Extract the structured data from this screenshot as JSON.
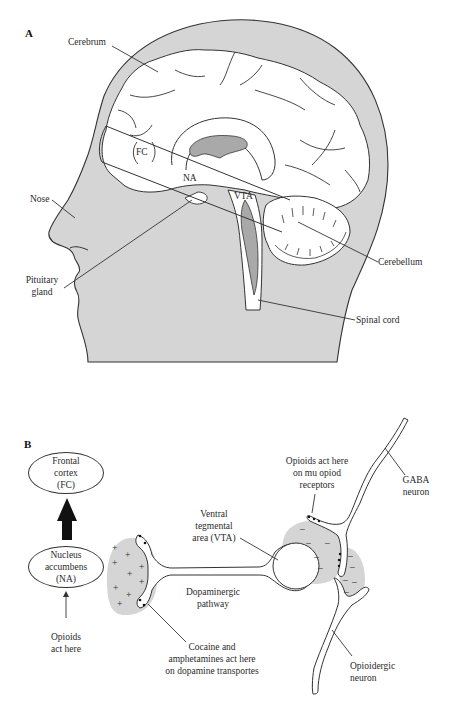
{
  "figure": {
    "panel_a": {
      "label": "A",
      "labels": {
        "cerebrum": "Cerebrum",
        "fc": "FC",
        "na": "NA",
        "vta": "VTA",
        "nose": "Nose",
        "pituitary_line1": "Pituitary",
        "pituitary_line2": "gland",
        "cerebellum": "Cerebellum",
        "spinal_cord": "Spinal cord"
      }
    },
    "panel_b": {
      "label": "B",
      "frontal_cortex": [
        "Frontal",
        "cortex",
        "(FC)"
      ],
      "nucleus_accumbens": [
        "Nucleus",
        "accumbens",
        "(NA)"
      ],
      "opioids_na": [
        "Opioids",
        "act here"
      ],
      "vta": [
        "Ventral",
        "tegmental",
        "area (VTA)"
      ],
      "pathway": [
        "Dopaminergic",
        "pathway"
      ],
      "cocaine": [
        "Cocaine and",
        "amphetamines act here",
        "on dopamine transportes"
      ],
      "mu_receptors": [
        "Opioids act here",
        "on mu opiod",
        "receptors"
      ],
      "gaba": [
        "GABA",
        "neuron"
      ],
      "opioidergic": [
        "Opioidergic",
        "neuron"
      ],
      "na_signs": "+",
      "vta_signs": "–"
    },
    "colors": {
      "head_fill": "#d5d5d5",
      "ventricle_fill": "#a9a9a9",
      "line": "#333333",
      "background": "#ffffff"
    }
  }
}
